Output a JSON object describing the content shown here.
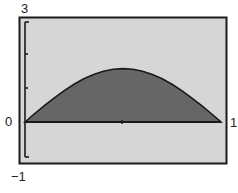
{
  "chart_data": {
    "type": "area",
    "title": "",
    "xlabel": "",
    "ylabel": "",
    "function_estimate": "y = (pi/2) * sin(pi * x)",
    "x": [
      0,
      0.05,
      0.1,
      0.15,
      0.2,
      0.25,
      0.3,
      0.35,
      0.4,
      0.45,
      0.5,
      0.55,
      0.6,
      0.65,
      0.7,
      0.75,
      0.8,
      0.85,
      0.9,
      0.95,
      1.0
    ],
    "series": [
      {
        "name": "shaded region",
        "values": [
          0,
          0.25,
          0.49,
          0.71,
          0.92,
          1.11,
          1.27,
          1.4,
          1.49,
          1.55,
          1.57,
          1.55,
          1.49,
          1.4,
          1.27,
          1.11,
          0.92,
          0.71,
          0.49,
          0.25,
          0
        ]
      }
    ],
    "xlim": [
      0,
      1
    ],
    "ylim": [
      -1,
      3
    ],
    "y_ticks": [
      -1,
      0,
      1,
      2,
      3
    ],
    "grid": false,
    "legend": "none",
    "tick_labels": {
      "y_max": "3",
      "y_zero": "0",
      "y_min": "−1",
      "x_max": "1"
    },
    "colors": {
      "plot_background": "#d6d6d6",
      "fill": "#666666",
      "curve": "#1a1a1a",
      "frame": "#1a1a1a"
    }
  }
}
